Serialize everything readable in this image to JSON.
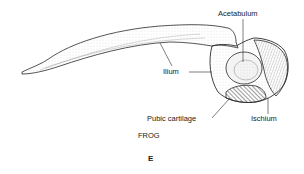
{
  "figure": {
    "panel_letter": "E",
    "species": "FROG",
    "labels": {
      "acetabulum": "Acetabulum",
      "ilium": "Ilium",
      "pubic_cartilage": "Pubic cartilage",
      "ischium": "Ischium"
    },
    "colors": {
      "line": "#2a2a2a",
      "stipple": "#8a8a8a",
      "background": "#ffffff"
    }
  }
}
